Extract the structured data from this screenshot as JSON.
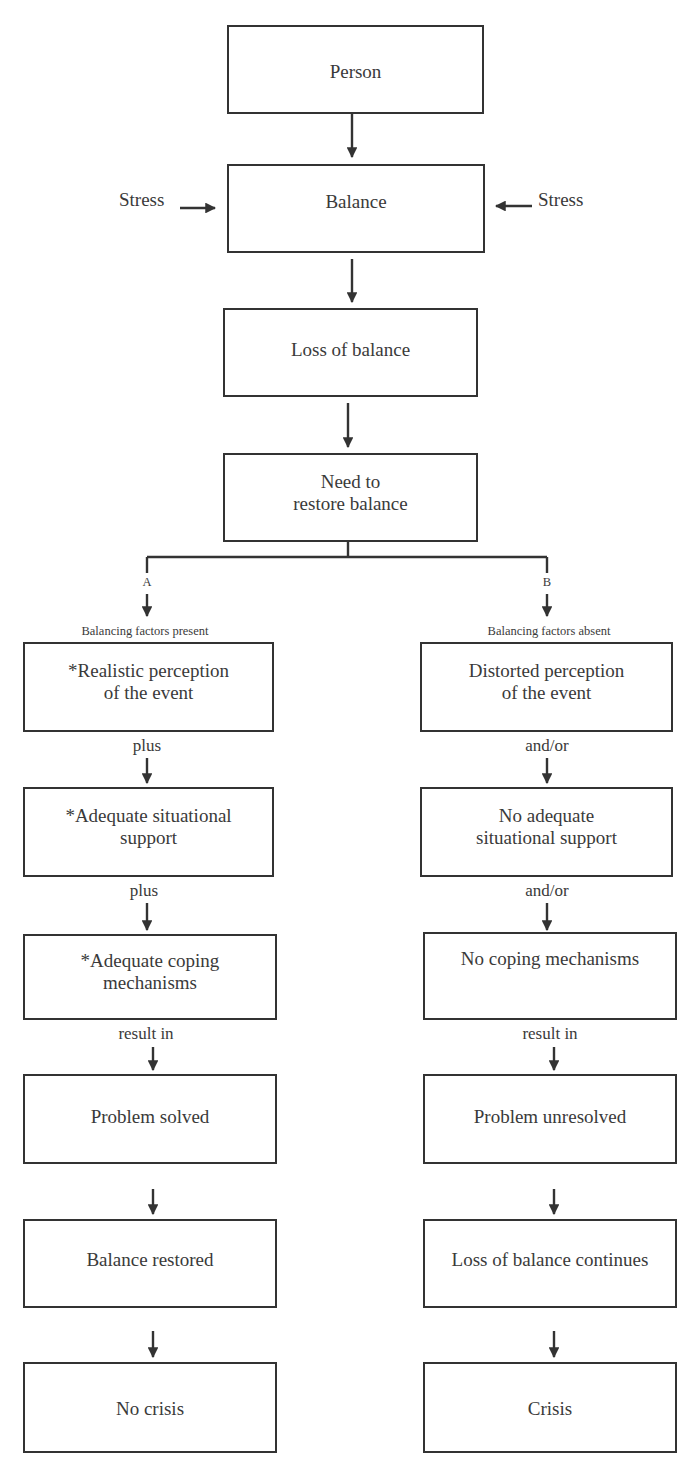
{
  "diagram": {
    "top": {
      "person": "Person",
      "balance": "Balance",
      "stress_left": "Stress",
      "stress_right": "Stress",
      "loss_of_balance": "Loss of balance",
      "need_line1": "Need to",
      "need_line2": "restore balance"
    },
    "branch_a": {
      "letter": "A",
      "heading": "Balancing factors present",
      "box1_line1": "*Realistic perception",
      "box1_line2": "of the event",
      "conn1": "plus",
      "box2_line1": "*Adequate situational",
      "box2_line2": "support",
      "conn2": "plus",
      "box3_line1": "*Adequate coping",
      "box3_line2": "mechanisms",
      "conn3": "result in",
      "box4": "Problem solved",
      "box5": "Balance restored",
      "box6": "No crisis"
    },
    "branch_b": {
      "letter": "B",
      "heading": "Balancing factors absent",
      "box1_line1": "Distorted perception",
      "box1_line2": "of the event",
      "conn1": "and/or",
      "box2_line1": "No adequate",
      "box2_line2": "situational support",
      "conn2": "and/or",
      "box3_line1": "No coping mechanisms",
      "conn3": "result in",
      "box4": "Problem unresolved",
      "box5": "Loss of balance continues",
      "box6": "Crisis"
    }
  }
}
